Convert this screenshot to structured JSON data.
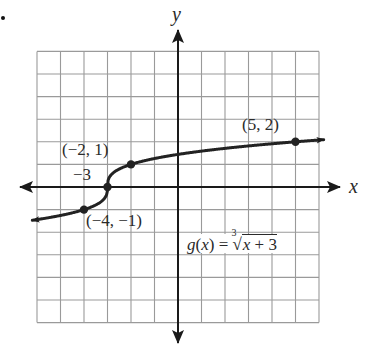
{
  "problem_marker": ".",
  "chart_data": {
    "type": "line",
    "title": "",
    "function_label": "g(x) = ∛(x + 3)",
    "function": {
      "name": "g",
      "var": "x",
      "index": "3",
      "radicand": "x + 3"
    },
    "xlabel": "x",
    "ylabel": "y",
    "xlim": [
      -6,
      6
    ],
    "ylim": [
      -6,
      6
    ],
    "grid": true,
    "grid_step": 1,
    "tick_labels": [],
    "series": [
      {
        "name": "g(x) = ∛(x + 3)",
        "x": [
          -6.2,
          -4,
          -3,
          -2,
          5,
          6.2
        ],
        "y": [
          -1.44,
          -1,
          0,
          1,
          2,
          2.1
        ],
        "arrows": "both",
        "color": "#222222"
      }
    ],
    "marked_points": [
      {
        "x": -4,
        "y": -1,
        "label": "(−4, −1)"
      },
      {
        "x": -3,
        "y": 0,
        "label": "−3"
      },
      {
        "x": -2,
        "y": 1,
        "label": "(−2, 1)"
      },
      {
        "x": 5,
        "y": 2,
        "label": "(5, 2)"
      }
    ]
  },
  "labels": {
    "x_axis": "x",
    "y_axis": "y",
    "pt_m4_m1": "(−4, −1)",
    "pt_m3": "−3",
    "pt_m2_1": "(−2, 1)",
    "pt_5_2": "(5, 2)",
    "eq_lhs": "g(",
    "eq_var": "x",
    "eq_mid": ") = ",
    "eq_index": "3",
    "eq_radicand_var": "x",
    "eq_radicand_rest": " + 3"
  },
  "colors": {
    "grid": "#9a9a9a",
    "axis": "#1a1a1a",
    "curve": "#222222",
    "background": "#ffffff"
  }
}
